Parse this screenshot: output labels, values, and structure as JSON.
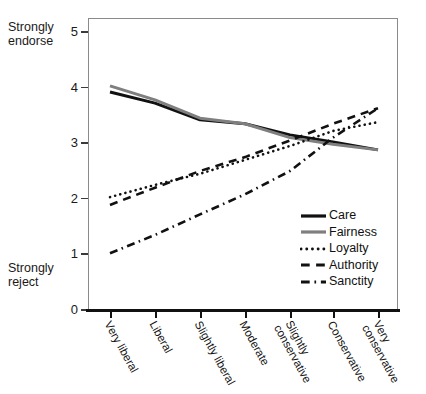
{
  "chart_data": {
    "type": "line",
    "title": "",
    "xlabel": "",
    "ylabel": "",
    "ylim": [
      0,
      5
    ],
    "yticks": [
      0,
      1,
      2,
      3,
      4,
      5
    ],
    "grid": false,
    "legend_position": "bottom-right",
    "y_axis_top_note": "Strongly\nendorse",
    "y_axis_bottom_note": "Strongly\nreject",
    "categories": [
      "Very liberal",
      "Liberal",
      "Slightly liberal",
      "Moderate",
      "Slightly\nconservative",
      "Conservative",
      "Very\nconservative"
    ],
    "series": [
      {
        "name": "Care",
        "style": "solid",
        "color": "#111111",
        "values": [
          3.92,
          3.72,
          3.42,
          3.35,
          3.15,
          3.02,
          2.88
        ]
      },
      {
        "name": "Fairness",
        "style": "solid",
        "color": "#7f7f7f",
        "values": [
          4.03,
          3.78,
          3.45,
          3.35,
          3.1,
          2.98,
          2.88
        ]
      },
      {
        "name": "Loyalty",
        "style": "dotted",
        "color": "#111111",
        "values": [
          2.03,
          2.25,
          2.45,
          2.7,
          2.95,
          3.22,
          3.38
        ]
      },
      {
        "name": "Authority",
        "style": "dashed",
        "color": "#111111",
        "values": [
          1.89,
          2.2,
          2.5,
          2.75,
          3.05,
          3.35,
          3.63
        ]
      },
      {
        "name": "Sanctity",
        "style": "dashdot",
        "color": "#111111",
        "values": [
          1.02,
          1.35,
          1.72,
          2.08,
          2.5,
          3.1,
          3.63
        ]
      }
    ]
  },
  "legend": {
    "items": [
      {
        "label": "Care"
      },
      {
        "label": "Fairness"
      },
      {
        "label": "Loyalty"
      },
      {
        "label": "Authority"
      },
      {
        "label": "Sanctity"
      }
    ]
  },
  "ticks": {
    "y": [
      "5",
      "4",
      "3",
      "2",
      "1",
      "0"
    ]
  }
}
